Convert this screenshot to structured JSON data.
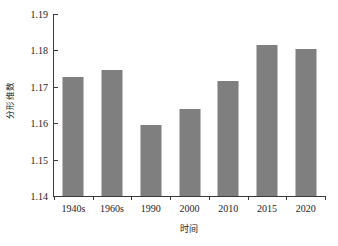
{
  "chart_data": {
    "type": "bar",
    "title": "",
    "xlabel": "时间",
    "ylabel": "分形维数",
    "categories": [
      "1940s",
      "1960s",
      "1990",
      "2000",
      "2010",
      "2015",
      "2020"
    ],
    "values": [
      1.1726,
      1.1747,
      1.1596,
      1.164,
      1.1715,
      1.1816,
      1.1805
    ],
    "ylim": [
      1.14,
      1.19
    ],
    "ytick_labels": [
      "1.14",
      "1.15",
      "1.16",
      "1.17",
      "1.18",
      "1.19"
    ],
    "ytick_values": [
      1.14,
      1.15,
      1.16,
      1.17,
      1.18,
      1.19
    ],
    "grid": false,
    "legend": null,
    "bar_color": "#7f7f7f",
    "axis_color": "#3a3a3a",
    "background": "#ffffff"
  }
}
